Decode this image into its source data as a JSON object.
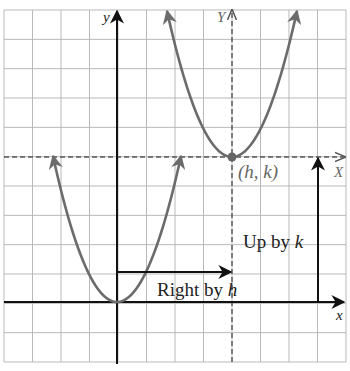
{
  "diagram": {
    "grid": {
      "columns": 12,
      "rows": 12,
      "cell_px": 28.5
    },
    "axes": {
      "x_label": "x",
      "y_label": "y",
      "shifted_x_label": "X",
      "shifted_y_label": "Y"
    },
    "vertex_label": "(h, k)",
    "right_shift_label_text": "Right by ",
    "right_shift_var": "h",
    "up_shift_label_text": "Up by ",
    "up_shift_var": "k",
    "colors": {
      "grid": "#b9b9b9",
      "axis": "#111111",
      "curve": "#6b6b6b",
      "dashed_axis": "#555555"
    }
  }
}
